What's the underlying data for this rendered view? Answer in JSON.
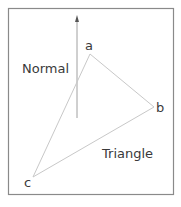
{
  "diagram": {
    "labels": {
      "vertex_a": "a",
      "vertex_b": "b",
      "vertex_c": "c",
      "normal": "Normal",
      "triangle": "Triangle"
    },
    "vertices": {
      "a": [
        90,
        54
      ],
      "b": [
        154,
        107
      ],
      "c": [
        33,
        177
      ]
    },
    "normal_arrow": {
      "x": 77,
      "y_start": 118,
      "y_end": 16
    },
    "colors": {
      "frame": "#8a8a8a",
      "edges": "#c8c8c8",
      "arrow": "#a0a0a0",
      "text": "#3a3a3a",
      "background": "#ffffff"
    }
  }
}
